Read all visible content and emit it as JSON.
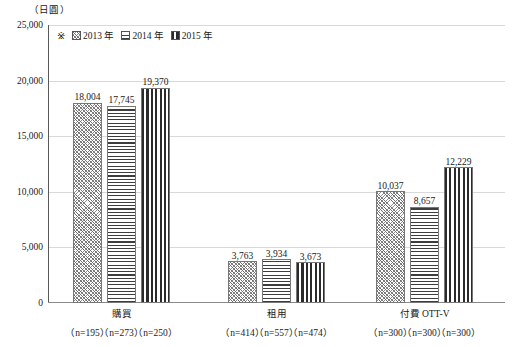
{
  "chart_data": {
    "type": "bar",
    "title": "",
    "subtitle": "",
    "unit_label": "（日圓）",
    "xlabel": "",
    "ylabel": "",
    "ylim": [
      0,
      25000
    ],
    "ytick_values": [
      0,
      5000,
      10000,
      15000,
      20000,
      25000
    ],
    "ytick_labels": [
      "0",
      "5,000",
      "10,000",
      "15,000",
      "20,000",
      "25,000"
    ],
    "grid": true,
    "legend_position": "top-left-inside",
    "legend_prefix": "※",
    "categories": [
      "購買",
      "租用",
      "付費 OTT-V"
    ],
    "series": [
      {
        "name": "2013 年",
        "pattern": "diagonal-crosshatch",
        "values": [
          18004,
          17745,
          10037
        ],
        "value_labels": [
          "18,004",
          "17,745",
          "10,037"
        ]
      },
      {
        "name": "2014 年",
        "pattern": "horizontal-lines",
        "values": [
          17745,
          3934,
          8657
        ],
        "value_labels": [
          "17,745",
          "3,934",
          "8,657"
        ]
      },
      {
        "name": "2015 年",
        "pattern": "vertical-lines",
        "values": [
          19370,
          3673,
          12229
        ],
        "value_labels": [
          "19,370",
          "3,673",
          "12,229"
        ]
      }
    ],
    "groups": [
      {
        "category": "購買",
        "bars": [
          {
            "series": "2013 年",
            "value": 18004,
            "label": "18,004",
            "n_label": "（n=195）"
          },
          {
            "series": "2014 年",
            "value": 17745,
            "label": "17,745",
            "n_label": "（n=273）"
          },
          {
            "series": "2015 年",
            "value": 19370,
            "label": "19,370",
            "n_label": "（n=250）"
          }
        ]
      },
      {
        "category": "租用",
        "bars": [
          {
            "series": "2013 年",
            "value": 3763,
            "label": "3,763",
            "n_label": "（n=414）"
          },
          {
            "series": "2014 年",
            "value": 3934,
            "label": "3,934",
            "n_label": "（n=557）"
          },
          {
            "series": "2015 年",
            "value": 3673,
            "label": "3,673",
            "n_label": "（n=474）"
          }
        ]
      },
      {
        "category": "付費 OTT-V",
        "bars": [
          {
            "series": "2013 年",
            "value": 10037,
            "label": "10,037",
            "n_label": "（n=300）"
          },
          {
            "series": "2014 年",
            "value": 8657,
            "label": "8,657",
            "n_label": "（n=300）"
          },
          {
            "series": "2015 年",
            "value": 12229,
            "label": "12,229",
            "n_label": "（n=300）"
          }
        ]
      }
    ],
    "colors": {
      "gridline": "#d9d9d9",
      "axis": "#595959",
      "bar_outline": "#777777",
      "text": "#1a1a1a"
    }
  }
}
